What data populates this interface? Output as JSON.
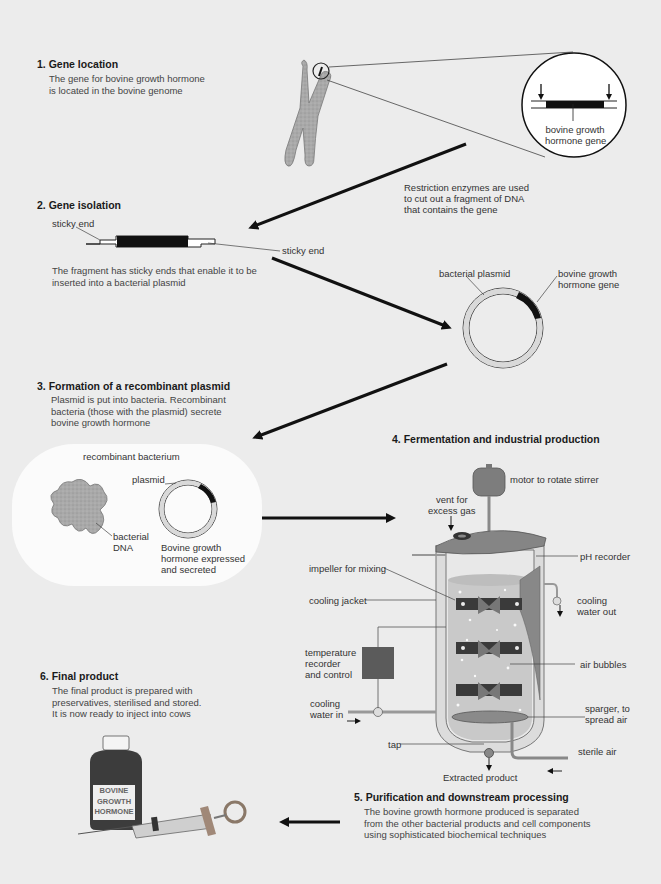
{
  "diagram": {
    "colors": {
      "background": "#ececec",
      "dark_fill": "#1a1a1a",
      "plasmid_ring": "#d9d9d9",
      "chromosome": "#a8a8a8",
      "fermenter_metal": "#7a7a7a",
      "bacterium_bg": "#fbfbfb",
      "bottle": "#3a3a3a"
    },
    "steps": [
      {
        "number": "1.",
        "title": "Gene location",
        "description": [
          "The gene for bovine growth hormone",
          "is located in the bovine genome"
        ]
      },
      {
        "number": "2.",
        "title": "Gene isolation",
        "description": [
          "The fragment has sticky ends that enable it to be",
          "inserted into a bacterial plasmid"
        ]
      },
      {
        "number": "3.",
        "title": "Formation of a recombinant plasmid",
        "description": [
          "Plasmid is put into bacteria. Recombinant",
          "bacteria (those with the plasmid) secrete",
          "bovine growth hormone"
        ]
      },
      {
        "number": "4.",
        "title": "Fermentation and industrial production",
        "description": []
      },
      {
        "number": "5.",
        "title": "Purification and downstream processing",
        "description": [
          "The bovine growth hormone produced is separated",
          "from the other bacterial products and cell components",
          "using  sophisticated biochemical techniques"
        ]
      },
      {
        "number": "6.",
        "title": "Final product",
        "description": [
          "The final product is prepared with",
          "preservatives, sterilised and stored.",
          "It is now ready to inject into cows"
        ]
      }
    ],
    "gene_callout": [
      "bovine growth",
      "hormone gene"
    ],
    "restriction_note": [
      "Restriction enzymes are used",
      "to cut out a fragment of DNA",
      "that contains the gene"
    ],
    "sticky_end_labels": [
      "sticky end",
      "sticky end"
    ],
    "plasmid_labels": {
      "bacterial_plasmid": "bacterial plasmid",
      "gene": [
        "bovine growth",
        "hormone gene"
      ]
    },
    "bacterium_labels": {
      "title": "recombinant bacterium",
      "plasmid": "plasmid",
      "dna": [
        "bacterial",
        "DNA"
      ],
      "expressed": [
        "Bovine growth",
        "hormone expressed",
        "and secreted"
      ]
    },
    "fermenter_labels": {
      "motor": "motor to rotate stirrer",
      "vent": [
        "vent for",
        "excess gas"
      ],
      "ph": "pH recorder",
      "impeller": "impeller for mixing",
      "jacket": "cooling jacket",
      "water_out": [
        "cooling",
        "water out"
      ],
      "temperature": [
        "temperature",
        "recorder",
        "and control"
      ],
      "bubbles": "air bubbles",
      "water_in": [
        "cooling",
        "water in"
      ],
      "sparger": [
        "sparger, to",
        "spread air"
      ],
      "tap": "tap",
      "sterile_air": "sterile air",
      "extracted": "Extracted product"
    },
    "bottle_label": [
      "BOVINE",
      "GROWTH",
      "HORMONE"
    ]
  }
}
